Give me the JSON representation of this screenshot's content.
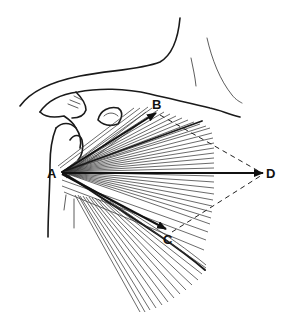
{
  "figure": {
    "labels": {
      "a": "A",
      "b": "B",
      "c": "C",
      "d": "D"
    },
    "colors": {
      "line": "#1a1a1a",
      "background": "#ffffff"
    }
  }
}
